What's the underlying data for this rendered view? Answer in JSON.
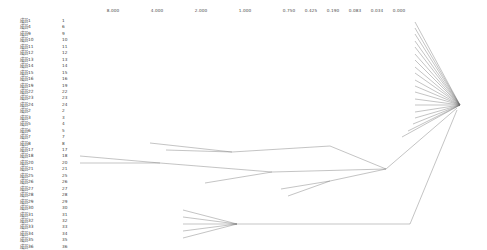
{
  "chart_data": {
    "type": "tree",
    "title": "",
    "subtitle": "",
    "xlabel": "",
    "ylabel": "",
    "axis": {
      "orientation": "horizontal-top",
      "direction": "right-to-left-decreasing",
      "range": [
        8.0,
        0.0
      ],
      "tick_labels": [
        "8.000",
        "4.000",
        "2.000",
        "1.000",
        "0.750",
        "0.425",
        "0.190",
        "0.083",
        "0.034",
        "0.000"
      ],
      "tick_x_px": [
        113,
        157,
        201,
        245,
        289,
        311,
        333,
        355,
        377,
        399
      ]
    },
    "grid": false,
    "legend": null,
    "leaf_count": 36,
    "leaves": [
      {
        "label": "成员1",
        "index": "1"
      },
      {
        "label": "成员4",
        "index": "6"
      },
      {
        "label": "成员9",
        "index": "9"
      },
      {
        "label": "成员10",
        "index": "10"
      },
      {
        "label": "成员11",
        "index": "11"
      },
      {
        "label": "成员12",
        "index": "12"
      },
      {
        "label": "成员13",
        "index": "13"
      },
      {
        "label": "成员14",
        "index": "14"
      },
      {
        "label": "成员15",
        "index": "15"
      },
      {
        "label": "成员16",
        "index": "16"
      },
      {
        "label": "成员19",
        "index": "19"
      },
      {
        "label": "成员22",
        "index": "22"
      },
      {
        "label": "成员23",
        "index": "23"
      },
      {
        "label": "成员24",
        "index": "24"
      },
      {
        "label": "成员2",
        "index": "2"
      },
      {
        "label": "成员3",
        "index": "3"
      },
      {
        "label": "成员5",
        "index": "4"
      },
      {
        "label": "成员6",
        "index": "5"
      },
      {
        "label": "成员7",
        "index": "7"
      },
      {
        "label": "成员8",
        "index": "8"
      },
      {
        "label": "成员17",
        "index": "17"
      },
      {
        "label": "成员18",
        "index": "18"
      },
      {
        "label": "成员20",
        "index": "20"
      },
      {
        "label": "成员21",
        "index": "21"
      },
      {
        "label": "成员25",
        "index": "25"
      },
      {
        "label": "成员26",
        "index": "26"
      },
      {
        "label": "成员27",
        "index": "27"
      },
      {
        "label": "成员28",
        "index": "28"
      },
      {
        "label": "成员29",
        "index": "29"
      },
      {
        "label": "成员30",
        "index": "30"
      },
      {
        "label": "成员31",
        "index": "31"
      },
      {
        "label": "成员32",
        "index": "32"
      },
      {
        "label": "成员33",
        "index": "33"
      },
      {
        "label": "成员34",
        "index": "34"
      },
      {
        "label": "成员35",
        "index": "35"
      },
      {
        "label": "成员36",
        "index": "36"
      }
    ],
    "edges": [
      {
        "x1": 415,
        "y1": 22,
        "x2": 460,
        "y2": 105
      },
      {
        "x1": 415,
        "y1": 28,
        "x2": 460,
        "y2": 105
      },
      {
        "x1": 415,
        "y1": 34,
        "x2": 460,
        "y2": 105
      },
      {
        "x1": 415,
        "y1": 41,
        "x2": 460,
        "y2": 105
      },
      {
        "x1": 415,
        "y1": 47,
        "x2": 460,
        "y2": 105
      },
      {
        "x1": 415,
        "y1": 54,
        "x2": 460,
        "y2": 105
      },
      {
        "x1": 415,
        "y1": 60,
        "x2": 460,
        "y2": 105
      },
      {
        "x1": 415,
        "y1": 67,
        "x2": 460,
        "y2": 105
      },
      {
        "x1": 415,
        "y1": 73,
        "x2": 460,
        "y2": 105
      },
      {
        "x1": 415,
        "y1": 80,
        "x2": 460,
        "y2": 105
      },
      {
        "x1": 415,
        "y1": 86,
        "x2": 460,
        "y2": 105
      },
      {
        "x1": 415,
        "y1": 92,
        "x2": 460,
        "y2": 105
      },
      {
        "x1": 415,
        "y1": 99,
        "x2": 460,
        "y2": 105
      },
      {
        "x1": 415,
        "y1": 105,
        "x2": 460,
        "y2": 105
      },
      {
        "x1": 415,
        "y1": 112,
        "x2": 460,
        "y2": 105
      },
      {
        "x1": 415,
        "y1": 118,
        "x2": 460,
        "y2": 105
      },
      {
        "x1": 413,
        "y1": 124,
        "x2": 460,
        "y2": 105
      },
      {
        "x1": 408,
        "y1": 131,
        "x2": 460,
        "y2": 105
      },
      {
        "x1": 402,
        "y1": 137,
        "x2": 460,
        "y2": 105
      },
      {
        "x1": 150,
        "y1": 143,
        "x2": 232,
        "y2": 152
      },
      {
        "x1": 166,
        "y1": 150,
        "x2": 232,
        "y2": 152
      },
      {
        "x1": 232,
        "y1": 152,
        "x2": 330,
        "y2": 146
      },
      {
        "x1": 330,
        "y1": 146,
        "x2": 386,
        "y2": 169
      },
      {
        "x1": 80,
        "y1": 156,
        "x2": 160,
        "y2": 163
      },
      {
        "x1": 80,
        "y1": 163,
        "x2": 160,
        "y2": 163
      },
      {
        "x1": 160,
        "y1": 163,
        "x2": 272,
        "y2": 172
      },
      {
        "x1": 205,
        "y1": 183,
        "x2": 272,
        "y2": 172
      },
      {
        "x1": 272,
        "y1": 172,
        "x2": 386,
        "y2": 169
      },
      {
        "x1": 386,
        "y1": 169,
        "x2": 457,
        "y2": 108
      },
      {
        "x1": 281,
        "y1": 189,
        "x2": 330,
        "y2": 181
      },
      {
        "x1": 288,
        "y1": 196,
        "x2": 330,
        "y2": 181
      },
      {
        "x1": 330,
        "y1": 181,
        "x2": 386,
        "y2": 169
      },
      {
        "x1": 183,
        "y1": 210,
        "x2": 237,
        "y2": 224
      },
      {
        "x1": 183,
        "y1": 217,
        "x2": 237,
        "y2": 224
      },
      {
        "x1": 183,
        "y1": 224,
        "x2": 237,
        "y2": 224
      },
      {
        "x1": 183,
        "y1": 231,
        "x2": 237,
        "y2": 224
      },
      {
        "x1": 183,
        "y1": 238,
        "x2": 237,
        "y2": 224
      },
      {
        "x1": 237,
        "y1": 224,
        "x2": 410,
        "y2": 224
      },
      {
        "x1": 410,
        "y1": 224,
        "x2": 457,
        "y2": 110
      }
    ]
  }
}
